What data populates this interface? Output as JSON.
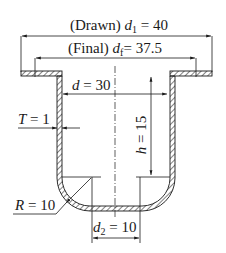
{
  "diagram": {
    "type": "engineering-cross-section",
    "labels": {
      "drawn_prefix": "(Drawn) ",
      "drawn_var": "d",
      "drawn_sub": "1",
      "drawn_value": " = 40",
      "final_prefix": "(Final) ",
      "final_var": "d",
      "final_sub": "f",
      "final_value": "= 37.5",
      "inner_diameter_var": "d",
      "inner_diameter_value": " = 30",
      "height_var": "h",
      "height_value": " = 15",
      "thickness_var": "T",
      "thickness_value": " = 1",
      "radius_var": "R",
      "radius_value": " = 10",
      "bottom_var": "d",
      "bottom_sub": "2",
      "bottom_value": " = 10"
    },
    "dimensions": {
      "drawn_flange_diameter": 40,
      "final_flange_diameter": 37.5,
      "inner_diameter": 30,
      "height": 15,
      "thickness": 1,
      "corner_radius": 10,
      "bottom_diameter": 10
    },
    "colors": {
      "line": "#1a1a1a",
      "background": "#ffffff"
    }
  }
}
